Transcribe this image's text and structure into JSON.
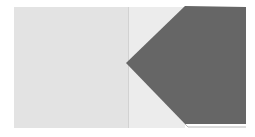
{
  "image": {
    "description": "Abstract graphic: light gray square panel with a dark gray pentagon arrow pointing left",
    "colors": {
      "background": "#ffffff",
      "left_panel": "#e3e3e3",
      "middle_panel": "#ececec",
      "divider": "#d2d2d2",
      "arrow_shape": "#666666"
    },
    "shapes": {
      "arrow_points": "126,63 185,6 246,7 246,124 185,124"
    }
  }
}
